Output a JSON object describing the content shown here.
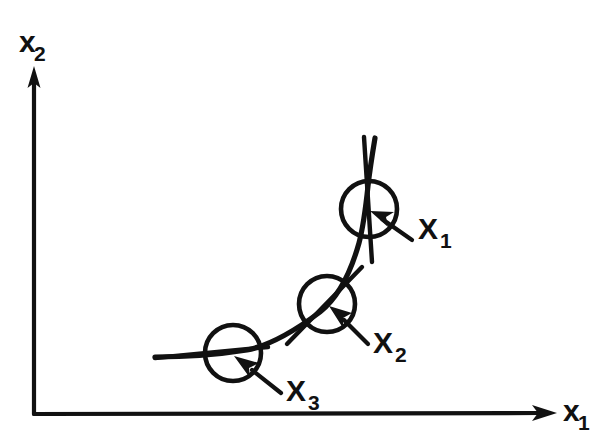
{
  "figure": {
    "type": "diagram",
    "title": "",
    "background_color": "#ffffff",
    "ink_color": "#111111"
  },
  "axes": {
    "x_axis": {
      "label": "x",
      "subscript": "1",
      "label_full": "x1",
      "direction": "right",
      "arrowhead": true,
      "origin": [
        34,
        414
      ],
      "end": [
        556,
        413
      ]
    },
    "y_axis": {
      "label": "x",
      "subscript": "2",
      "label_full": "x2",
      "direction": "up",
      "arrowhead": true,
      "origin": [
        34,
        414
      ],
      "end": [
        34,
        68
      ]
    }
  },
  "curve": {
    "name": "trajectory",
    "style": "solid",
    "stroke_width": 5.2,
    "points": [
      [
        155,
        357
      ],
      [
        200,
        356
      ],
      [
        247,
        350
      ],
      [
        288,
        336
      ],
      [
        320,
        312
      ],
      [
        345,
        280
      ],
      [
        359,
        243
      ],
      [
        366,
        205
      ],
      [
        371,
        168
      ],
      [
        375,
        138
      ]
    ]
  },
  "markers": [
    {
      "id": "X1",
      "label": "X",
      "subscript": "1",
      "label_full": "X1",
      "circle": {
        "cx": 369,
        "cy": 209,
        "r": 28
      },
      "tangent": {
        "x1": 364,
        "y1": 137,
        "x2": 372,
        "y2": 262,
        "angle_deg": 86
      },
      "pointer": {
        "from": [
          412,
          240
        ],
        "to": [
          372,
          212
        ]
      },
      "label_pos": {
        "x": 418,
        "y": 238
      }
    },
    {
      "id": "X2",
      "label": "X",
      "subscript": "2",
      "label_full": "X2",
      "circle": {
        "cx": 327,
        "cy": 304,
        "r": 28
      },
      "tangent": {
        "x1": 289,
        "y1": 342,
        "x2": 361,
        "y2": 268,
        "angle_deg": 45
      },
      "pointer": {
        "from": [
          368,
          344
        ],
        "to": [
          331,
          308
        ]
      },
      "label_pos": {
        "x": 373,
        "y": 352
      }
    },
    {
      "id": "X3",
      "label": "X",
      "subscript": "3",
      "label_full": "X3",
      "circle": {
        "cx": 233,
        "cy": 353,
        "r": 28
      },
      "tangent": {
        "x1": 155,
        "y1": 357,
        "x2": 300,
        "y2": 340,
        "angle_deg": 7
      },
      "pointer": {
        "from": [
          280,
          392
        ],
        "to": [
          237,
          357
        ]
      },
      "label_pos": {
        "x": 285,
        "y": 400
      }
    }
  ]
}
